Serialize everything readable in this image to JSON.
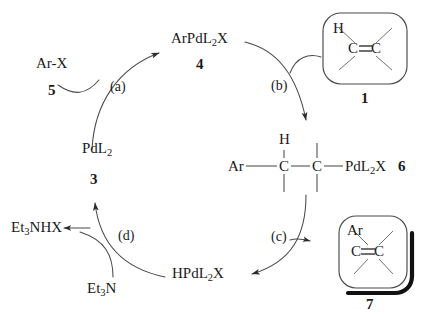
{
  "diagram": {
    "background_color": "#ffffff",
    "line_color": "#3a3a3a",
    "text_color": "#1a1a1a"
  },
  "species": {
    "ar_x": {
      "formula_main": "Ar-X",
      "number": "5"
    },
    "arpdl2x": {
      "prefix": "ArPdL",
      "sub": "2",
      "suffix": "X",
      "number": "4"
    },
    "pdl2": {
      "prefix": "PdL",
      "sub": "2",
      "suffix": "",
      "number": "3"
    },
    "hpdl2x": {
      "prefix": "HPdL",
      "sub": "2",
      "suffix": "X",
      "number": ""
    },
    "et3nhx": {
      "prefix": "Et",
      "sub": "3",
      "suffix": "NHX"
    },
    "et3n": {
      "prefix": "Et",
      "sub": "3",
      "suffix": "N"
    },
    "insertion_complex": {
      "ar": "Ar",
      "h": "H",
      "c1": "C",
      "c2": "C",
      "pd_prefix": "PdL",
      "pd_sub": "2",
      "pd_suffix": "X",
      "number": "6"
    }
  },
  "boxes": [
    {
      "id": "alkene-substrate",
      "number": "1",
      "substituent": "H",
      "left_atom": "C",
      "right_atom": "C",
      "bond": "double",
      "shadow": false
    },
    {
      "id": "alkene-product",
      "number": "7",
      "substituent": "Ar",
      "left_atom": "C",
      "right_atom": "C",
      "bond": "double",
      "shadow": true
    }
  ],
  "steps": [
    {
      "id": "a",
      "label": "(a)",
      "name": "oxidative-addition"
    },
    {
      "id": "b",
      "label": "(b)",
      "name": "alkene-coordination-insertion"
    },
    {
      "id": "c",
      "label": "(c)",
      "name": "beta-hydride-elimination"
    },
    {
      "id": "d",
      "label": "(d)",
      "name": "reductive-elimination-base"
    }
  ]
}
